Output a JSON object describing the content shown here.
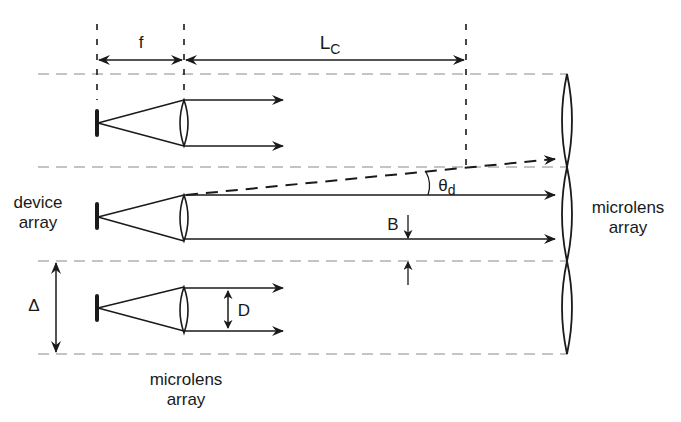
{
  "figure": {
    "colors": {
      "line": "#1a1a1a",
      "dash": "#888888",
      "background": "#ffffff"
    }
  },
  "labels": {
    "f": "f",
    "Lc_main": "L",
    "Lc_sub": "C",
    "theta_main": "θ",
    "theta_sub": "d",
    "B": "B",
    "D": "D",
    "Delta": "Δ",
    "device_array_line1": "device",
    "device_array_line2": "array",
    "microlens_left_line1": "microlens",
    "microlens_left_line2": "array",
    "microlens_right_line1": "microlens",
    "microlens_right_line2": "array"
  },
  "geometry": {
    "channel_boundaries_y": [
      74,
      167,
      261,
      354
    ],
    "device_x": 97,
    "lens_x": 184,
    "Lc_end_x": 466,
    "far_array_x": 567,
    "rows": [
      {
        "name": "top",
        "lens_top": 100,
        "lens_bottom": 146,
        "arrow_end_x": 283
      },
      {
        "name": "middle",
        "lens_top": 195,
        "lens_bottom": 241,
        "arrow_end_x": 555
      },
      {
        "name": "bottom",
        "lens_top": 287,
        "lens_bottom": 333,
        "arrow_end_x": 283
      }
    ]
  }
}
